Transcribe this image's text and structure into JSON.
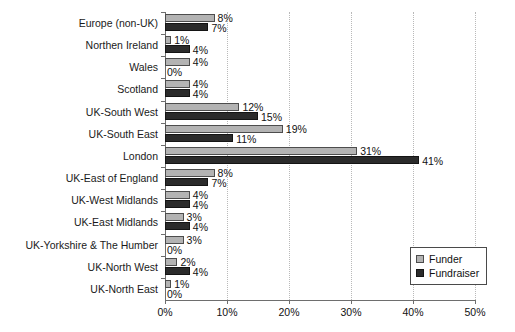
{
  "chart_data": {
    "type": "bar",
    "orientation": "horizontal",
    "title": "",
    "xlabel": "",
    "ylabel": "",
    "xlim": [
      0,
      50
    ],
    "xticks": [
      0,
      10,
      20,
      30,
      40,
      50
    ],
    "xtick_labels": [
      "0%",
      "10%",
      "20%",
      "30%",
      "40%",
      "50%"
    ],
    "grid": "vertical-dotted",
    "legend_position": "bottom-right",
    "value_label_suffix": "%",
    "categories": [
      "Europe (non-UK)",
      "Northen Ireland",
      "Wales",
      "Scotland",
      "UK-South West",
      "UK-South East",
      "London",
      "UK-East of England",
      "UK-West Midlands",
      "UK-East Midlands",
      "UK-Yorkshire & The Humber",
      "UK-North West",
      "UK-North East"
    ],
    "series": [
      {
        "name": "Funder",
        "color": "#b3b3b3",
        "values": [
          8,
          1,
          4,
          4,
          12,
          19,
          31,
          8,
          4,
          3,
          3,
          2,
          1
        ],
        "labels": [
          "8%",
          "1%",
          "4%",
          "4%",
          "12%",
          "19%",
          "31%",
          "8%",
          "4%",
          "3%",
          "3%",
          "2%",
          "1%"
        ]
      },
      {
        "name": "Fundraiser",
        "color": "#2b2b2b",
        "values": [
          7,
          4,
          0,
          4,
          15,
          11,
          41,
          7,
          4,
          4,
          0,
          4,
          0
        ],
        "labels": [
          "7%",
          "4%",
          "0%",
          "4%",
          "15%",
          "11%",
          "41%",
          "7%",
          "4%",
          "4%",
          "0%",
          "4%",
          "0%"
        ]
      }
    ]
  },
  "legend": {
    "items": [
      {
        "label": "Funder"
      },
      {
        "label": "Fundraiser"
      }
    ]
  }
}
